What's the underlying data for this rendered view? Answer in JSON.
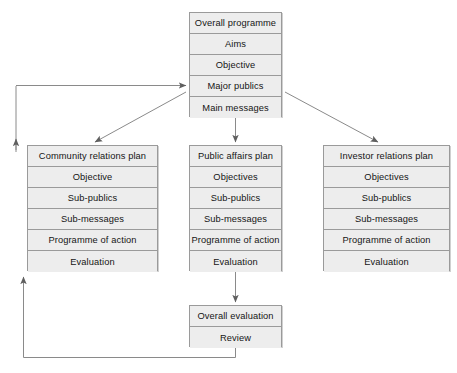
{
  "diagram": {
    "colors": {
      "box_fill": "#ededed",
      "box_border": "#9a9a9a",
      "text": "#151515",
      "connector": "#7a7a7a",
      "background": "#ffffff"
    }
  },
  "overall_programme": {
    "rows": [
      {
        "label": "Overall programme"
      },
      {
        "label": "Aims"
      },
      {
        "label": "Objective"
      },
      {
        "label": "Major publics"
      },
      {
        "label": "Main messages"
      }
    ]
  },
  "community_relations_plan": {
    "rows": [
      {
        "label": "Community relations plan"
      },
      {
        "label": "Objective"
      },
      {
        "label": "Sub-publics"
      },
      {
        "label": "Sub-messages"
      },
      {
        "label": "Programme of action"
      },
      {
        "label": "Evaluation"
      }
    ]
  },
  "public_affairs_plan": {
    "rows": [
      {
        "label": "Public affairs plan"
      },
      {
        "label": "Objectives"
      },
      {
        "label": "Sub-publics"
      },
      {
        "label": "Sub-messages"
      },
      {
        "label": "Programme of action"
      },
      {
        "label": "Evaluation"
      }
    ]
  },
  "investor_relations_plan": {
    "rows": [
      {
        "label": "Investor relations plan"
      },
      {
        "label": "Objectives"
      },
      {
        "label": "Sub-publics"
      },
      {
        "label": "Sub-messages"
      },
      {
        "label": "Programme of action"
      },
      {
        "label": "Evaluation"
      }
    ]
  },
  "overall_evaluation": {
    "rows": [
      {
        "label": "Overall evaluation"
      },
      {
        "label": "Review"
      }
    ]
  },
  "connectors": [
    {
      "name": "main-messages-to-community-plan",
      "kind": "diagonal-arrow"
    },
    {
      "name": "main-messages-to-public-affairs-plan",
      "kind": "vertical-arrow"
    },
    {
      "name": "main-messages-to-investor-plan",
      "kind": "diagonal-arrow"
    },
    {
      "name": "public-affairs-plan-to-overall-evaluation",
      "kind": "vertical-arrow"
    },
    {
      "name": "inner-feedback-loop-to-major-publics",
      "kind": "feedback-arrow"
    },
    {
      "name": "outer-feedback-loop-from-overall-evaluation",
      "kind": "feedback-arrow"
    }
  ]
}
